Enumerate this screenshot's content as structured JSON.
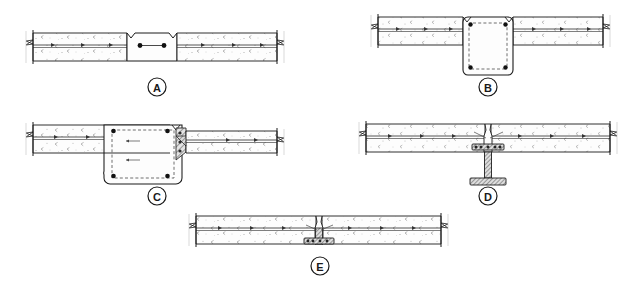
{
  "drawing": {
    "title": "Slab-to-support connection details",
    "sheet_background": "#ffffff",
    "line_color": "#1a1a1a",
    "concrete_fill": "#fdfdfd",
    "hatch_color": "#8a8a8a",
    "rebar_color": "#111111",
    "steel_fill": "#d9d9d9",
    "detail_count": 5
  },
  "details": [
    {
      "id": "A",
      "label": "A",
      "label_shape": "circle",
      "caption": "A",
      "support_type": "concrete-block-band",
      "description": "Continuous slab with thickened center band containing two longitudinal rebars joined by a tie line; V-notch control joints at top each side of band.",
      "slab": {
        "left_break": true,
        "right_break": true,
        "layers": 3
      },
      "rebar_count": 2,
      "has_stirrup": false,
      "has_steel_section": false,
      "column_below": false
    },
    {
      "id": "B",
      "label": "B",
      "label_shape": "circle",
      "caption": "B",
      "support_type": "concrete-column-square",
      "description": "Slab supported on square reinforced concrete column with rounded corners, four corner rebars and a dashed closed stirrup; V-notch joints at slab/column interface.",
      "slab": {
        "left_break": true,
        "right_break": true,
        "layers": 3
      },
      "rebar_count": 4,
      "has_stirrup": true,
      "has_steel_section": false,
      "column_below": true
    },
    {
      "id": "C",
      "label": "C",
      "label_shape": "circle",
      "caption": "C",
      "support_type": "concrete-column-with-corbel",
      "description": "Slab on wide reinforced concrete column with four rebars and dashed stirrups; hatched corbel/bearing bracket with anchors at the right face supporting the adjoining slab.",
      "slab": {
        "left_break": true,
        "right_break": true,
        "layers": 3
      },
      "rebar_count": 4,
      "has_stirrup": true,
      "has_corbel": true,
      "has_steel_section": false,
      "column_below": true
    },
    {
      "id": "D",
      "label": "D",
      "label_shape": "circle",
      "caption": "D",
      "support_type": "steel-column-tee",
      "description": "Slab bearing on a steel tee/I column with hatched web, head plate with shear studs at slab soffit and a spread base plate below.",
      "slab": {
        "left_break": true,
        "right_break": true,
        "layers": 3
      },
      "rebar_count": 0,
      "has_stirrup": false,
      "has_steel_section": true,
      "column_below": true
    },
    {
      "id": "E",
      "label": "E",
      "label_shape": "circle",
      "caption": "E",
      "support_type": "steel-stub-embedded",
      "description": "Slab with short embedded steel stub post and bearing plate flush with the soffit; V-notch joint in the slab top over the stub.",
      "slab": {
        "left_break": true,
        "right_break": true,
        "layers": 3
      },
      "rebar_count": 0,
      "has_stirrup": false,
      "has_steel_section": true,
      "column_below": false
    }
  ]
}
